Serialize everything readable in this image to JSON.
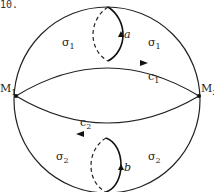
{
  "figure": {
    "number_label": "10.",
    "nodes": [
      {
        "id": "M1",
        "label": "M",
        "subscript": "1"
      },
      {
        "id": "M2",
        "label": "M",
        "subscript": "2"
      }
    ],
    "regions": [
      {
        "label": "σ",
        "subscript": "1",
        "position": "upper-left"
      },
      {
        "label": "σ",
        "subscript": "1",
        "position": "upper-right"
      },
      {
        "label": "σ",
        "subscript": "2",
        "position": "lower-left"
      },
      {
        "label": "σ",
        "subscript": "2",
        "position": "lower-right"
      }
    ],
    "curves": [
      {
        "label": "c",
        "subscript": "1",
        "direction": "M1 to M2"
      },
      {
        "label": "c",
        "subscript": "2",
        "direction": "M2 to M1"
      }
    ],
    "loops": [
      {
        "label": "a",
        "position": "upper"
      },
      {
        "label": "b",
        "position": "lower"
      }
    ]
  }
}
